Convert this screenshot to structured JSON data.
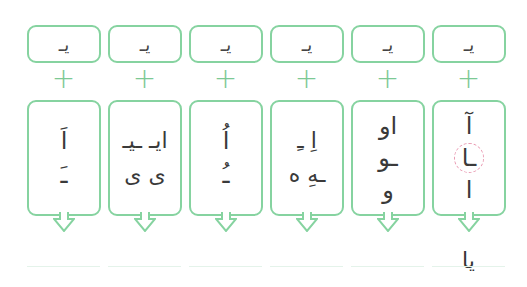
{
  "colors": {
    "box_border": "#86d3a0",
    "plus": "#7cc994",
    "highlight_circle": "#e99ab2",
    "answer_line": "#e4f3ea"
  },
  "columns": [
    {
      "top": "یـ",
      "plus": "+",
      "rows": [
        "اَ",
        "ـَ"
      ],
      "answer": ""
    },
    {
      "top": "یـ",
      "plus": "+",
      "rows": [
        "ایـ  ـیـ",
        "ی  ی"
      ],
      "answer": ""
    },
    {
      "top": "یـ",
      "plus": "+",
      "rows": [
        "اُ",
        "ـُ"
      ],
      "answer": ""
    },
    {
      "top": "یـ",
      "plus": "+",
      "rows": [
        "اِ   ـِ",
        "ـهِ   ه"
      ],
      "answer": ""
    },
    {
      "top": "یـ",
      "plus": "+",
      "rows": [
        "او",
        "ـو",
        "و"
      ],
      "answer": ""
    },
    {
      "top": "یـ",
      "plus": "+",
      "rows": [
        "آ",
        "ـا",
        "ا"
      ],
      "highlight_row": 1,
      "answer": "یا"
    }
  ]
}
